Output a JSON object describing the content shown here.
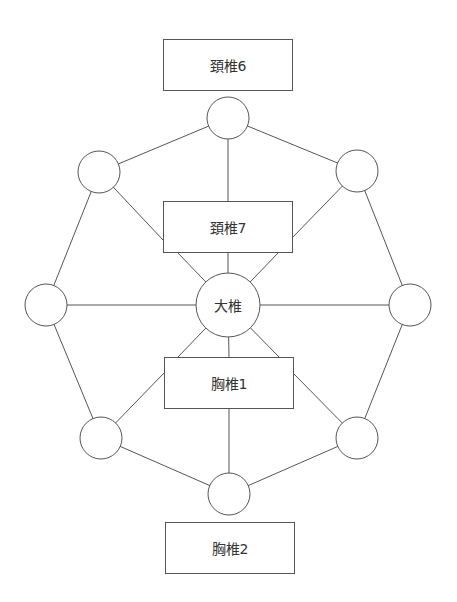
{
  "diagram": {
    "stroke_color": "#555555",
    "boxes": [
      {
        "id": "c6",
        "label": "頚椎6",
        "x": 163,
        "y": 39,
        "w": 129,
        "h": 51
      },
      {
        "id": "c7",
        "label": "頚椎7",
        "x": 163,
        "y": 201,
        "w": 129,
        "h": 51
      },
      {
        "id": "t1",
        "label": "胸椎1",
        "x": 164,
        "y": 357,
        "w": 129,
        "h": 51
      },
      {
        "id": "t2",
        "label": "胸椎2",
        "x": 165,
        "y": 522,
        "w": 129,
        "h": 51
      }
    ],
    "center_node": {
      "id": "dazhui",
      "label": "大椎",
      "cx": 228,
      "cy": 305,
      "r": 32
    },
    "outer_nodes": [
      {
        "id": "top",
        "label": "",
        "cx": 228,
        "cy": 118,
        "r": 21
      },
      {
        "id": "upper-right",
        "label": "",
        "cx": 357,
        "cy": 171,
        "r": 21
      },
      {
        "id": "right",
        "label": "",
        "cx": 410,
        "cy": 305,
        "r": 21
      },
      {
        "id": "lower-right",
        "label": "",
        "cx": 357,
        "cy": 438,
        "r": 21
      },
      {
        "id": "bottom",
        "label": "",
        "cx": 229,
        "cy": 494,
        "r": 21
      },
      {
        "id": "lower-left",
        "label": "",
        "cx": 101,
        "cy": 438,
        "r": 21
      },
      {
        "id": "left",
        "label": "",
        "cx": 46,
        "cy": 305,
        "r": 21
      },
      {
        "id": "upper-left",
        "label": "",
        "cx": 99,
        "cy": 172,
        "r": 21
      }
    ]
  }
}
